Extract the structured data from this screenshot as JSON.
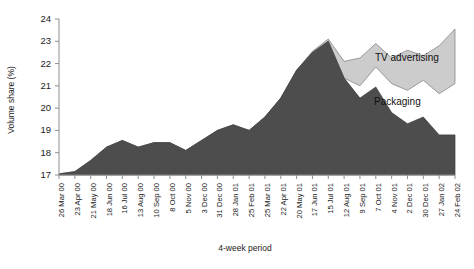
{
  "chart_data": {
    "type": "area",
    "title": "",
    "subtitle": "",
    "xlabel": "4-week period",
    "ylabel": "Volume share (%)",
    "ylim": [
      17,
      24
    ],
    "yticks": [
      17,
      18,
      19,
      20,
      21,
      22,
      23,
      24
    ],
    "grid": false,
    "legend_position": "inline-annotations",
    "stacked": true,
    "categories": [
      "26 Mar 00",
      "23 Apr 00",
      "21 May 00",
      "18 Jun 00",
      "16 Jul 00",
      "13 Aug 00",
      "10 Sep 00",
      "8 Oct 00",
      "5 Nov 00",
      "3 Dec 00",
      "31 Dec 00",
      "28 Jan 01",
      "25 Feb 01",
      "25 Mar 01",
      "22 Apr 01",
      "20 May 01",
      "17 Jun 01",
      "15 Jul 01",
      "12 Aug 01",
      "9 Sep 01",
      "7 Oct 01",
      "4 Nov 01",
      "2 Dec 01",
      "30 Dec 01",
      "27 Jan 02",
      "24 Feb 02"
    ],
    "series": [
      {
        "name": "Packaging",
        "color": "#4d4d4d",
        "values": [
          17.05,
          17.15,
          17.65,
          18.25,
          18.55,
          18.25,
          18.45,
          18.45,
          18.1,
          18.55,
          19.0,
          19.25,
          19.0,
          19.6,
          20.45,
          21.7,
          22.5,
          23.0,
          21.35,
          20.45,
          20.95,
          19.8,
          19.3,
          19.6,
          18.8,
          18.8
        ]
      },
      {
        "name": "TV advertising",
        "color": "#cccccc",
        "band_lower": [
          17.05,
          17.15,
          17.65,
          18.25,
          18.55,
          18.25,
          18.45,
          18.45,
          18.1,
          18.55,
          19.0,
          19.25,
          19.0,
          19.6,
          20.45,
          21.7,
          22.5,
          23.0,
          21.35,
          21.0,
          21.85,
          21.1,
          20.8,
          21.25,
          20.65,
          21.1
        ],
        "band_upper": [
          17.05,
          17.15,
          17.65,
          18.25,
          18.55,
          18.25,
          18.45,
          18.45,
          18.1,
          18.55,
          19.0,
          19.25,
          19.0,
          19.6,
          20.45,
          21.7,
          22.55,
          23.1,
          22.1,
          22.25,
          22.9,
          22.25,
          22.6,
          22.35,
          22.8,
          23.55
        ]
      }
    ],
    "annotations": [
      {
        "text": "TV advertising",
        "x": 375,
        "y": 61
      },
      {
        "text": "Packaging",
        "x": 374,
        "y": 105
      }
    ]
  }
}
